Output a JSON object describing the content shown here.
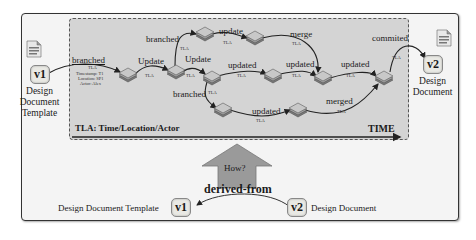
{
  "top_diagram": {
    "start": {
      "version": "v1",
      "name_lines": [
        "Design",
        "Document",
        "Template"
      ]
    },
    "end": {
      "version": "v2",
      "name_lines": [
        "Design",
        "Document"
      ]
    },
    "first_edge": {
      "label": "branched",
      "tla": "TLA",
      "meta": [
        "Timestamp: T1",
        "Location: SP1",
        "Actor: Alex"
      ]
    },
    "edges": [
      {
        "id": "update1",
        "label": "Update",
        "tla": "TLA"
      },
      {
        "id": "branched_up",
        "label": "branched",
        "tla": "TLA"
      },
      {
        "id": "update_top",
        "label": "update",
        "tla": "TLA"
      },
      {
        "id": "merge",
        "label": "merge",
        "tla": "TLA"
      },
      {
        "id": "update2",
        "label": "Update",
        "tla": "TLA"
      },
      {
        "id": "updated_mid1",
        "label": "updated",
        "tla": "TLA"
      },
      {
        "id": "updated_mid2",
        "label": "updated",
        "tla": "TLA"
      },
      {
        "id": "updated_mid3",
        "label": "updated",
        "tla": "TLA"
      },
      {
        "id": "branched_down",
        "label": "branched",
        "tla": "TLA"
      },
      {
        "id": "updated_low",
        "label": "updated",
        "tla": "TLA"
      },
      {
        "id": "merged",
        "label": "merged",
        "tla": "TLA"
      },
      {
        "id": "commited",
        "label": "commited",
        "tla": "TLA"
      }
    ],
    "legend": "TLA: Time/Location/Actor",
    "axis_label": "TIME"
  },
  "arrow": {
    "label": "How?"
  },
  "bottom_relation": {
    "label": "derived-from",
    "left": {
      "version": "v1",
      "name": "Design Document Template"
    },
    "right": {
      "version": "v2",
      "name": "Design Document"
    }
  },
  "colors": {
    "panel": "#d4d4d4",
    "frame_bg": "#f4f4f4",
    "arrow_fill": "#9a9a9a",
    "node_fill": "#8c8c8c"
  }
}
